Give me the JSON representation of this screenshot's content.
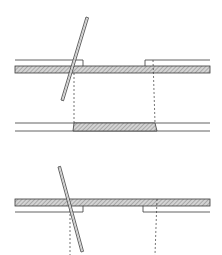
{
  "diagram": {
    "colors": {
      "line": "#3a3a3a",
      "hatch": "#9a9a9a",
      "hatch_bg": "#d4d4d4",
      "background": "#ffffff"
    },
    "parts": [
      {
        "id": "top-assembly",
        "label": "upper plate with step and tilted needle"
      },
      {
        "id": "middle-band",
        "label": "projected hatched section"
      },
      {
        "id": "bottom-assembly",
        "label": "lower plate with step and tilted needle"
      }
    ],
    "text": []
  }
}
